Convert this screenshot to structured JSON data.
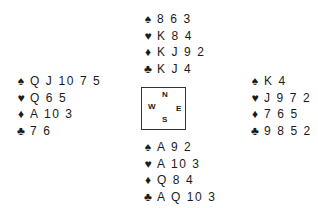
{
  "suits": {
    "spades": "♠",
    "hearts": "♥",
    "diamonds": "♦",
    "clubs": "♣"
  },
  "compass": {
    "north": "N",
    "west": "W",
    "east": "E",
    "south": "S"
  },
  "hands": {
    "north": {
      "spades": "8 6 3",
      "hearts": "K 8 4",
      "diamonds": "K J 9 2",
      "clubs": "K J 4"
    },
    "west": {
      "spades": "Q J 10 7 5",
      "hearts": "Q 6 5",
      "diamonds": "A 10 3",
      "clubs": "7 6"
    },
    "east": {
      "spades": "K 4",
      "hearts": "J 9 7 2",
      "diamonds": "7 6 5",
      "clubs": "9 8 5 2"
    },
    "south": {
      "spades": "A 9 2",
      "hearts": "A 10 3",
      "diamonds": "Q 8 4",
      "clubs": "A Q 10 3"
    }
  }
}
